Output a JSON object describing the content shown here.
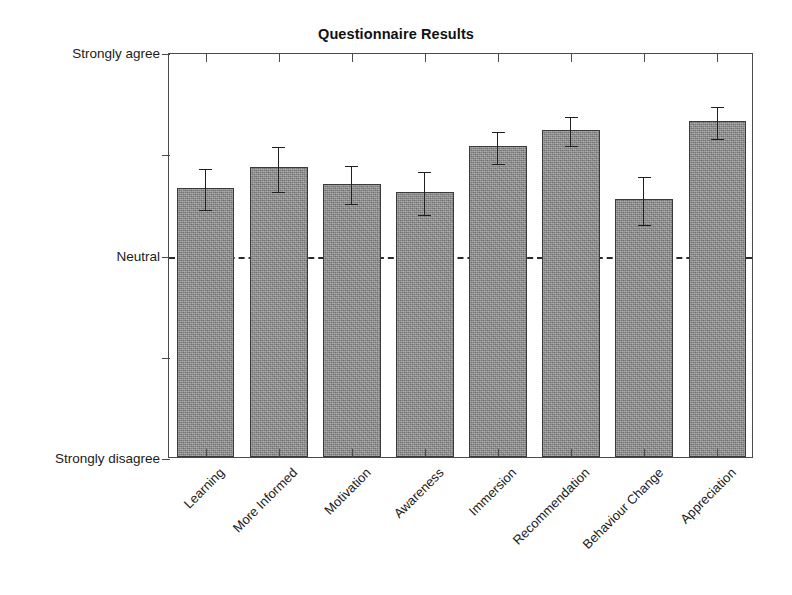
{
  "chart_data": {
    "type": "bar",
    "title": "Questionnaire Results",
    "xlabel": "",
    "ylabel": "",
    "categories": [
      "Learning",
      "More Informed",
      "Motivation",
      "Awareness",
      "Immersion",
      "Recommendation",
      "Behaviour Change",
      "Appreciation"
    ],
    "values": [
      3.66,
      3.86,
      3.7,
      3.62,
      4.07,
      4.23,
      3.55,
      4.32
    ],
    "errors_upper": [
      0.2,
      0.22,
      0.19,
      0.21,
      0.16,
      0.15,
      0.24,
      0.16
    ],
    "errors_lower": [
      0.21,
      0.23,
      0.19,
      0.22,
      0.17,
      0.15,
      0.25,
      0.17
    ],
    "ylim": [
      1,
      5
    ],
    "ytick_values": [
      1,
      2,
      3,
      4,
      5
    ],
    "ytick_labels": [
      "Strongly disagree",
      "",
      "Neutral",
      "",
      "Strongly agree"
    ],
    "reference_line": {
      "value": 3,
      "label": "Neutral",
      "style": "dashed"
    },
    "grid": false,
    "legend": null,
    "bar_color": "#8d8d8d",
    "bar_edge_color": "#3a3a3a",
    "error_color": "#1f1f1f",
    "axis_color": "#4a4a4a",
    "background": "#ffffff"
  },
  "axis": {
    "y_top_label": "Strongly agree",
    "y_mid_label": "Neutral",
    "y_bottom_label": "Strongly disagree"
  }
}
